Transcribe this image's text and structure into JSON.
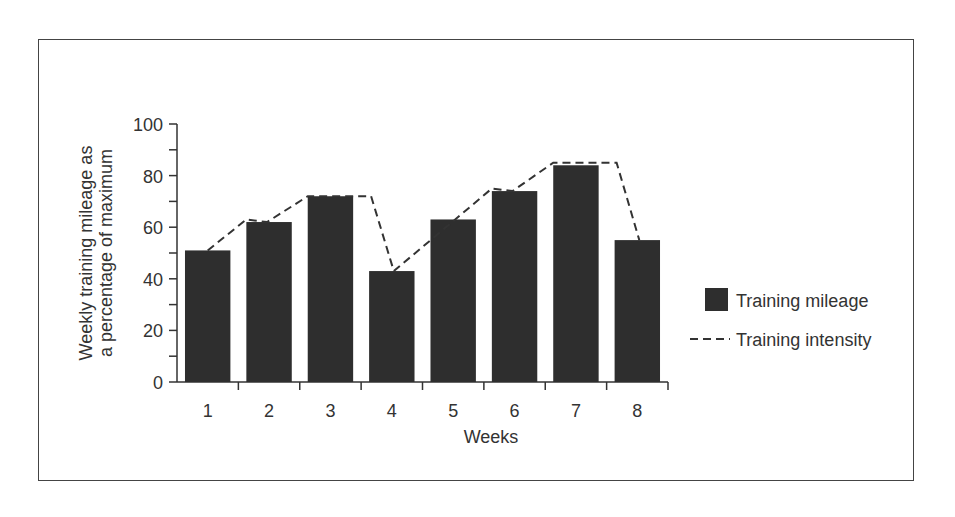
{
  "chart_data": {
    "type": "bar",
    "title": "",
    "xlabel": "Weeks",
    "ylabel": "Weekly training mileage as a percentage of maximum",
    "ylabel_lines": [
      "Weekly training mileage as",
      "a percentage of maximum"
    ],
    "categories": [
      "1",
      "2",
      "3",
      "4",
      "5",
      "6",
      "7",
      "8"
    ],
    "ylim": [
      0,
      100
    ],
    "yticks": [
      "0",
      "20",
      "40",
      "60",
      "80",
      "100"
    ],
    "grid": false,
    "legend_position": "right",
    "series": [
      {
        "name": "Training mileage",
        "type": "bar",
        "color": "#2e2e2e",
        "values": [
          51,
          62,
          72,
          43,
          63,
          74,
          84,
          55
        ]
      },
      {
        "name": "Training intensity",
        "type": "line",
        "style": "dashed",
        "color": "#333333",
        "values": [
          51,
          63,
          72,
          72,
          63,
          75,
          85,
          85
        ]
      }
    ]
  },
  "legend": {
    "items": [
      {
        "label": "Training mileage",
        "icon": "filled-square"
      },
      {
        "label": "Training intensity",
        "icon": "dashed-line"
      }
    ]
  }
}
